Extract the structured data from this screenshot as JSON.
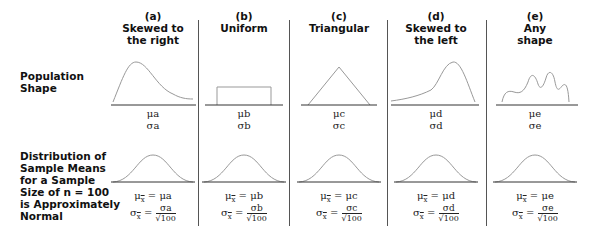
{
  "row_labels": {
    "population": [
      "Population",
      "Shape"
    ],
    "sampling": [
      "Distribution of",
      "Sample Means",
      "for a Sample",
      "Size of n = 100",
      "is Approximately",
      "Normal"
    ]
  },
  "columns": [
    {
      "letter": "(a)",
      "title_lines": [
        "Skewed to",
        "the right"
      ],
      "shape": "right-skewed",
      "mu": "μa",
      "sigma": "σa",
      "mu_sym": "μ",
      "sigma_sym": "σ",
      "param": "a",
      "xbar": "x",
      "sqrt_n": "√100",
      "eq": "="
    },
    {
      "letter": "(b)",
      "title_lines": [
        "Uniform"
      ],
      "shape": "uniform",
      "mu": "μb",
      "sigma": "σb",
      "mu_sym": "μ",
      "sigma_sym": "σ",
      "param": "b",
      "xbar": "x",
      "sqrt_n": "√100",
      "eq": "="
    },
    {
      "letter": "(c)",
      "title_lines": [
        "Triangular"
      ],
      "shape": "triangular",
      "mu": "μc",
      "sigma": "σc",
      "mu_sym": "μ",
      "sigma_sym": "σ",
      "param": "c",
      "xbar": "x",
      "sqrt_n": "√100",
      "eq": "="
    },
    {
      "letter": "(d)",
      "title_lines": [
        "Skewed to",
        "the left"
      ],
      "shape": "left-skewed",
      "mu": "μd",
      "sigma": "σd",
      "mu_sym": "μ",
      "sigma_sym": "σ",
      "param": "d",
      "xbar": "x",
      "sqrt_n": "√100",
      "eq": "="
    },
    {
      "letter": "(e)",
      "title_lines": [
        "Any",
        "shape"
      ],
      "shape": "multimodal",
      "mu": "μe",
      "sigma": "σe",
      "mu_sym": "μ",
      "sigma_sym": "σ",
      "param": "e",
      "xbar": "x",
      "sqrt_n": "√100",
      "eq": "="
    }
  ],
  "sample_size": "n = 100",
  "sampling_shape": "normal",
  "colors": {
    "curve": "#999999",
    "axis": "#333333",
    "divider": "#555555",
    "text": "#111111"
  }
}
